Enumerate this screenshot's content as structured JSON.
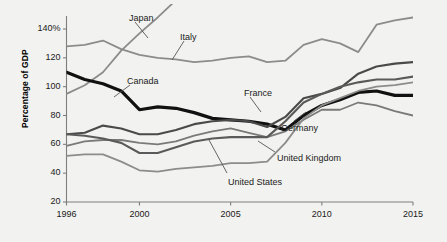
{
  "chart_data": {
    "type": "line",
    "title": "",
    "subtitle": "",
    "xlabel": "",
    "ylabel": "Percentage of GDP",
    "xlim": [
      1996,
      2015
    ],
    "ylim": [
      20,
      150
    ],
    "grid": false,
    "legend_position": "inline-labels",
    "x": [
      1996,
      1997,
      1998,
      1999,
      2000,
      2001,
      2002,
      2003,
      2004,
      2005,
      2006,
      2007,
      2008,
      2009,
      2010,
      2011,
      2012,
      2013,
      2014,
      2015
    ],
    "ytick_labels": [
      "20",
      "40",
      "60",
      "80",
      "100",
      "120",
      "140%"
    ],
    "ytick_values": [
      20,
      40,
      60,
      80,
      100,
      120,
      140
    ],
    "xtick_labels": [
      "1996",
      "2000",
      "2005",
      "2010",
      "2015"
    ],
    "xtick_values": [
      1996,
      2000,
      2005,
      2010,
      2015
    ],
    "series": [
      {
        "name": "Japan",
        "label": "Japan",
        "color": "#8c8c8c",
        "width": 1.8,
        "values": [
          95,
          101,
          110,
          125,
          137,
          148,
          160,
          170,
          178,
          183,
          186,
          183,
          191,
          210,
          216,
          229,
          237,
          244,
          249,
          248
        ],
        "clipped_above": true
      },
      {
        "name": "Italy",
        "label": "Italy",
        "color": "#8c8c8c",
        "width": 1.8,
        "values": [
          128,
          129,
          132,
          126,
          122,
          120,
          119,
          117,
          118,
          120,
          121,
          117,
          118,
          129,
          133,
          130,
          124,
          143,
          146,
          148
        ]
      },
      {
        "name": "Canada",
        "label": "Canada",
        "color": "#111111",
        "width": 3.2,
        "values": [
          110,
          105,
          102,
          97,
          84,
          86,
          85,
          82,
          78,
          77,
          76,
          74,
          70,
          80,
          87,
          91,
          96,
          97,
          94,
          94
        ]
      },
      {
        "name": "France",
        "label": "France",
        "color": "#4a4a4a",
        "width": 2.1,
        "values": [
          67,
          68,
          73,
          71,
          67,
          67,
          70,
          74,
          76,
          77,
          76,
          72,
          79,
          92,
          95,
          99,
          109,
          114,
          116,
          117
        ]
      },
      {
        "name": "Germany",
        "label": "Germany",
        "color": "#7a7a7a",
        "width": 1.8,
        "values": [
          59,
          62,
          63,
          63,
          61,
          60,
          62,
          66,
          69,
          71,
          68,
          65,
          69,
          77,
          84,
          84,
          89,
          87,
          83,
          80
        ]
      },
      {
        "name": "United Kingdom",
        "label": "United Kingdom",
        "color": "#8c8c8c",
        "width": 1.8,
        "values": [
          52,
          53,
          53,
          48,
          42,
          41,
          43,
          44,
          45,
          47,
          47,
          48,
          61,
          78,
          87,
          92,
          97,
          100,
          101,
          103
        ]
      },
      {
        "name": "United States",
        "label": "United States",
        "color": "#5a5a5a",
        "width": 2.1,
        "values": [
          67,
          66,
          64,
          61,
          54,
          54,
          58,
          62,
          64,
          65,
          65,
          65,
          76,
          89,
          95,
          100,
          103,
          105,
          105,
          107
        ]
      }
    ],
    "annotations": [
      {
        "text": "Japan",
        "x": 129,
        "y": 13,
        "leader": [
          [
            135,
            22
          ],
          [
            148,
            38
          ]
        ]
      },
      {
        "text": "Italy",
        "x": 180,
        "y": 32,
        "leader": [
          [
            184,
            41
          ],
          [
            172,
            60
          ]
        ]
      },
      {
        "text": "Canada",
        "x": 127,
        "y": 76,
        "leader": [
          [
            130,
            85
          ],
          [
            114,
            97
          ]
        ]
      },
      {
        "text": "France",
        "x": 244,
        "y": 88,
        "leader": [
          [
            250,
            97
          ],
          [
            261,
            112
          ]
        ]
      },
      {
        "text": "Germany",
        "x": 281,
        "y": 123,
        "leader": [
          [
            294,
            121
          ],
          [
            306,
            112
          ]
        ]
      },
      {
        "text": "United Kingdom",
        "x": 277,
        "y": 153,
        "leader": [
          [
            275,
            152
          ],
          [
            258,
            141
          ]
        ]
      },
      {
        "text": "United States",
        "x": 228,
        "y": 177,
        "leader": [
          [
            227,
            173
          ],
          [
            209,
            140
          ]
        ]
      }
    ]
  }
}
